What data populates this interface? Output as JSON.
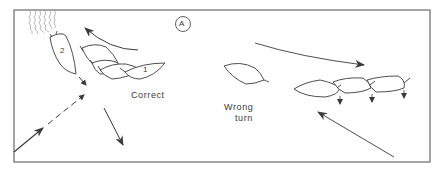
{
  "figure": {
    "panel_label": "A",
    "labels": {
      "correct": "Correct",
      "wrong_line1": "Wrong",
      "wrong_line2": "turn"
    },
    "boats": {
      "boat_2": "2",
      "boat_1": "1"
    },
    "colors": {
      "ink": "#3a3a3a",
      "frame": "#6a6a6a",
      "background": "#ffffff"
    }
  }
}
